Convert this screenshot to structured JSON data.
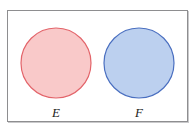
{
  "figure": {
    "name": "venn-diagram-disjoint-sets",
    "type": "set-diagram",
    "frame": {
      "border_color": "#8e8e90",
      "background_color": "#ffffff"
    },
    "sets": [
      {
        "id": "set-e",
        "label": "E",
        "fill_color": "#f9c9c9",
        "stroke_color": "#e3646a",
        "center_x": 56,
        "center_y": 63,
        "radius": 35
      },
      {
        "id": "set-f",
        "label": "F",
        "fill_color": "#bcd0ef",
        "stroke_color": "#4a6fc0",
        "center_x": 139,
        "center_y": 63,
        "radius": 35
      }
    ]
  }
}
